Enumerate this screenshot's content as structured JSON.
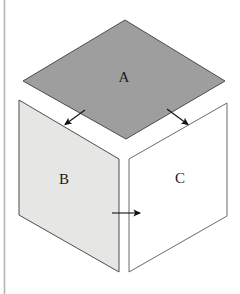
{
  "figure": {
    "caption": "",
    "background_color": "#ffffff",
    "margin_rule": {
      "name": "left-margin-rule",
      "color": "#b5b5b5",
      "x": 4.5,
      "y_top": 0,
      "y_bottom": 294,
      "width": 1.6
    },
    "faces": [
      {
        "id": "A",
        "label": "A",
        "role": "top-face",
        "shape": "rhombus",
        "fill": "#9e9e9e",
        "stroke": "#4d4d4d",
        "stroke_width": 1,
        "points": "125,20 225,81 126,139 23,81",
        "label_x": 124,
        "label_y": 79
      },
      {
        "id": "B",
        "label": "B",
        "role": "left-face",
        "shape": "parallelogram",
        "fill": "#e6e6e4",
        "stroke": "#4d4d4d",
        "stroke_width": 1,
        "points": "19,100 119,159 119,272 19,215",
        "label_x": 64,
        "label_y": 181
      },
      {
        "id": "C",
        "label": "C",
        "role": "right-face",
        "shape": "parallelogram",
        "fill": "#ffffff",
        "stroke": "#6b6b6b",
        "stroke_width": 1,
        "points": "129,159 227,103 227,216 129,272",
        "label_x": 180,
        "label_y": 180
      }
    ],
    "arrows": [
      {
        "id": "arrow-a-to-b",
        "label": "",
        "direction": "down-left",
        "color": "#111111",
        "x1": 85,
        "y1": 110,
        "x2": 63,
        "y2": 126
      },
      {
        "id": "arrow-a-to-c",
        "label": "",
        "direction": "down-right",
        "color": "#111111",
        "x1": 167,
        "y1": 109,
        "x2": 190,
        "y2": 126
      },
      {
        "id": "arrow-b-to-c",
        "label": "",
        "direction": "right",
        "color": "#111111",
        "x1": 112,
        "y1": 213,
        "x2": 143,
        "y2": 213
      }
    ],
    "colors": {
      "top_face": "#9e9e9e",
      "left_face": "#e6e6e4",
      "right_face": "#ffffff",
      "outline": "#4d4d4d",
      "arrow": "#111111",
      "margin_rule": "#b5b5b5"
    }
  }
}
